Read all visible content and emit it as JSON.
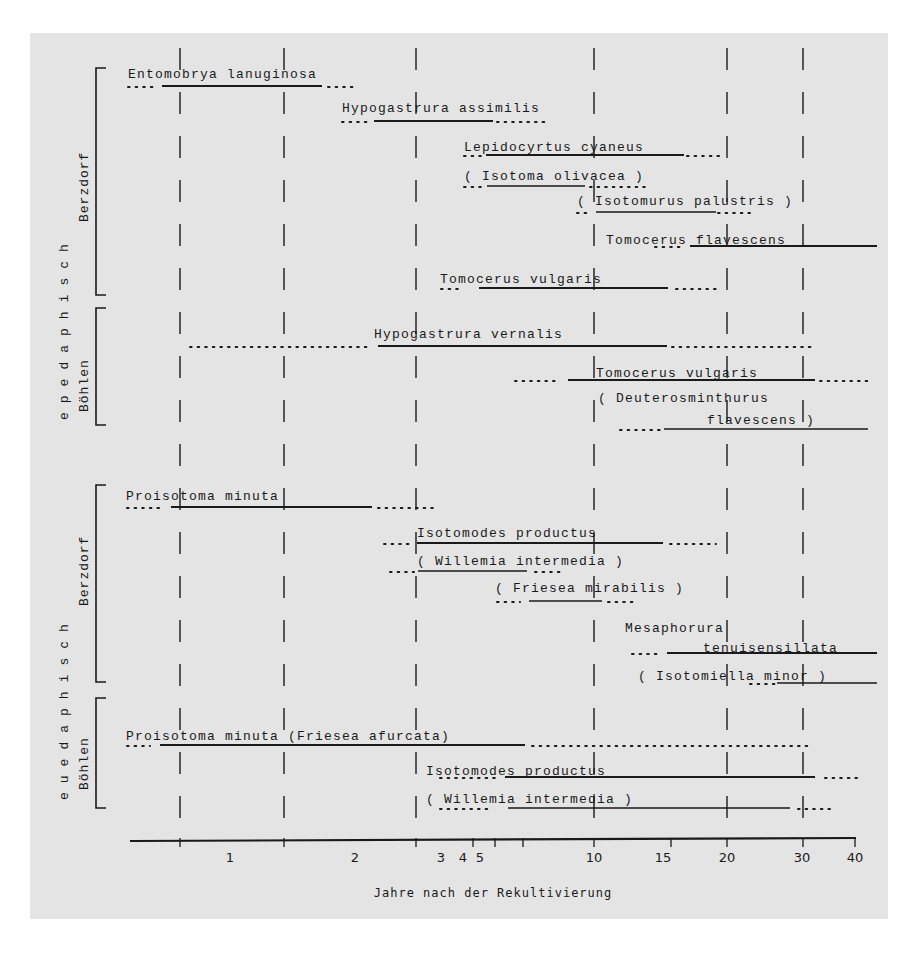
{
  "chart_data": {
    "type": "timeline",
    "title": "",
    "xlabel": "Jahre nach der Rekultivierung",
    "ylabel": "",
    "x_scale": "log-like (years)",
    "xlim": [
      0,
      40
    ],
    "x_ticks": [
      {
        "label": "",
        "px": 180
      },
      {
        "label": "1",
        "px": 230,
        "label_only": true
      },
      {
        "label": "",
        "px": 284
      },
      {
        "label": "2",
        "px": 355,
        "label_only": true
      },
      {
        "label": "",
        "px": 416
      },
      {
        "label": "3",
        "px": 444,
        "label_only": true
      },
      {
        "label": "4",
        "px": 462,
        "tick_px": 473
      },
      {
        "label": "5",
        "px": 480,
        "tick_px": 495
      },
      {
        "label": "",
        "px": 523
      },
      {
        "label": "10",
        "px": 594
      },
      {
        "label": "15",
        "px": 671
      },
      {
        "label": "20",
        "px": 727
      },
      {
        "label": "30",
        "px": 803
      },
      {
        "label": "40",
        "px": 855
      }
    ],
    "gridlines_dashed_px": [
      180,
      284,
      416,
      594,
      727,
      803
    ],
    "grid": "dashed vertical",
    "zones": [
      {
        "name": "epedaphisch",
        "y_top": 60,
        "y_bottom": 430
      },
      {
        "name": "euedaphisch",
        "y_top": 480,
        "y_bottom": 812
      }
    ],
    "groups": [
      {
        "name": "Berzdorf",
        "zone": "epedaphisch",
        "y_top": 68,
        "y_bottom": 295
      },
      {
        "name": "Böhlen",
        "zone": "epedaphisch",
        "y_top": 308,
        "y_bottom": 425
      },
      {
        "name": "Berzdorf",
        "zone": "euedaphisch",
        "y_top": 485,
        "y_bottom": 682
      },
      {
        "name": "Böhlen",
        "zone": "euedaphisch",
        "y_top": 698,
        "y_bottom": 808
      }
    ],
    "series": [
      {
        "name": "Entomobrya lanuginosa",
        "site": "Berzdorf",
        "zone": "epedaphisch",
        "parenthetical": false,
        "label_x": 128,
        "label_y": 78,
        "line_y": 86,
        "dots_pre": [
          128,
          158
        ],
        "solid": [
          162,
          322
        ],
        "dots_post": [
          328,
          358
        ]
      },
      {
        "name": "Hypogastrura assimilis",
        "site": "Berzdorf",
        "zone": "epedaphisch",
        "parenthetical": false,
        "label_x": 342,
        "label_y": 112,
        "line_y": 121,
        "dots_pre": [
          342,
          372
        ],
        "solid": [
          374,
          493
        ],
        "dots_post": [
          497,
          545
        ]
      },
      {
        "name": "Lepidocyrtus cyaneus",
        "site": "Berzdorf",
        "zone": "epedaphisch",
        "parenthetical": false,
        "label_x": 464,
        "label_y": 151,
        "line_y": 155,
        "dots_pre": [
          464,
          484
        ],
        "solid": [
          486,
          684
        ],
        "dots_post": [
          687,
          722
        ]
      },
      {
        "name": "( Isotoma olivacea )",
        "site": "Berzdorf",
        "zone": "epedaphisch",
        "parenthetical": true,
        "label_x": 464,
        "label_y": 180,
        "line_y": 186,
        "dots_pre": [
          464,
          484
        ],
        "solid": [
          487,
          585
        ],
        "dots_post": [
          590,
          650
        ]
      },
      {
        "name": "( Isotomurus palustris )",
        "site": "Berzdorf",
        "zone": "epedaphisch",
        "parenthetical": true,
        "label_x": 577,
        "label_y": 205,
        "line_y": 212,
        "dots_pre": [
          577,
          590
        ],
        "solid": [
          596,
          716
        ],
        "dots_post": [
          718,
          752
        ]
      },
      {
        "name": "Tomocerus flavescens",
        "site": "Berzdorf",
        "zone": "epedaphisch",
        "parenthetical": false,
        "label_x": 606,
        "label_y": 244,
        "line_y": 246,
        "dots_pre": [
          655,
          685
        ],
        "solid": [
          690,
          877
        ],
        "dots_post": null
      },
      {
        "name": "Tomocerus vulgaris",
        "site": "Berzdorf",
        "zone": "epedaphisch",
        "parenthetical": false,
        "label_x": 440,
        "label_y": 283,
        "line_y": 288,
        "dots_pre": [
          441,
          462
        ],
        "solid": [
          479,
          668
        ],
        "dots_post": [
          676,
          718
        ]
      },
      {
        "name": "Hypogastrura vernalis",
        "site": "Böhlen",
        "zone": "epedaphisch",
        "parenthetical": false,
        "label_x": 374,
        "label_y": 338,
        "line_y": 346,
        "dots_pre": [
          190,
          370
        ],
        "solid": [
          378,
          667
        ],
        "dots_post": [
          672,
          812
        ]
      },
      {
        "name": "Tomocerus vulgaris",
        "site": "Böhlen",
        "zone": "epedaphisch",
        "parenthetical": false,
        "label_x": 596,
        "label_y": 377,
        "line_y": 380,
        "dots_pre": [
          515,
          555
        ],
        "solid": [
          568,
          815
        ],
        "dots_post": [
          820,
          868
        ]
      },
      {
        "name": "( Deuterosminthurus",
        "name2": "flavescens )",
        "site": "Böhlen",
        "zone": "epedaphisch",
        "parenthetical": true,
        "label_x": 598,
        "label_y": 402,
        "label2_x": 707,
        "label2_y": 424,
        "line_y": 429,
        "dots_pre": [
          620,
          660
        ],
        "solid": [
          664,
          868
        ],
        "dots_post": null
      },
      {
        "name": "Proisotoma minuta",
        "site": "Berzdorf",
        "zone": "euedaphisch",
        "parenthetical": false,
        "label_x": 126,
        "label_y": 500,
        "line_y": 507,
        "dots_pre": [
          127,
          160
        ],
        "solid": [
          171,
          372
        ],
        "dots_post": [
          378,
          437
        ]
      },
      {
        "name": "Isotomodes productus",
        "site": "Berzdorf",
        "zone": "euedaphisch",
        "parenthetical": false,
        "label_x": 417,
        "label_y": 537,
        "line_y": 543,
        "dots_pre": [
          384,
          410
        ],
        "solid": [
          417,
          663
        ],
        "dots_post": [
          670,
          716
        ]
      },
      {
        "name": "( Willemia intermedia )",
        "site": "Berzdorf",
        "zone": "euedaphisch",
        "parenthetical": true,
        "label_x": 417,
        "label_y": 565,
        "line_y": 571,
        "dots_pre": [
          390,
          414
        ],
        "solid": [
          418,
          527
        ],
        "dots_post": [
          535,
          560
        ]
      },
      {
        "name": "( Friesea mirabilis )",
        "site": "Berzdorf",
        "zone": "euedaphisch",
        "parenthetical": true,
        "label_x": 495,
        "label_y": 592,
        "line_y": 601,
        "dots_pre": [
          497,
          520
        ],
        "solid": [
          529,
          602
        ],
        "dots_post": [
          608,
          634
        ]
      },
      {
        "name": "Mesaphorura",
        "name2": "tenuisensillata",
        "site": "Berzdorf",
        "zone": "euedaphisch",
        "parenthetical": false,
        "label_x": 625,
        "label_y": 632,
        "label2_x": 703,
        "label2_y": 652,
        "line_y": 653,
        "dots_pre": [
          632,
          660
        ],
        "solid": [
          667,
          877
        ],
        "dots_post": null
      },
      {
        "name": "( Isotomiella minor )",
        "site": "Berzdorf",
        "zone": "euedaphisch",
        "parenthetical": true,
        "label_x": 638,
        "label_y": 680,
        "line_y": 683,
        "dots_pre": [
          750,
          775
        ],
        "solid": [
          777,
          877
        ],
        "dots_post": null
      },
      {
        "name": "Proisotoma minuta (Friesea afurcata)",
        "site": "Böhlen",
        "zone": "euedaphisch",
        "parenthetical": false,
        "label_x": 126,
        "label_y": 740,
        "line_y": 745,
        "dots_pre": [
          127,
          150
        ],
        "solid": [
          160,
          525
        ],
        "dots_post": [
          532,
          812
        ]
      },
      {
        "name": "Isotomodes productus",
        "site": "Böhlen",
        "zone": "euedaphisch",
        "parenthetical": false,
        "label_x": 426,
        "label_y": 775,
        "line_y": 777,
        "dots_pre": [
          440,
          495
        ],
        "solid": [
          505,
          815
        ],
        "dots_post": [
          825,
          860
        ]
      },
      {
        "name": "( Willemia intermedia )",
        "site": "Böhlen",
        "zone": "euedaphisch",
        "parenthetical": true,
        "label_x": 426,
        "label_y": 803,
        "line_y": 808,
        "dots_pre": [
          440,
          490
        ],
        "solid": [
          508,
          790
        ],
        "dots_post": [
          798,
          830
        ]
      }
    ],
    "legend": "solid line = present; dotted line = sporadic/uncertain; parentheses = uncertain assignment"
  },
  "axis": {
    "title": "Jahre nach der Rekultivierung",
    "line": {
      "x1": 130,
      "x2": 856,
      "y": 840
    },
    "ticks": [
      {
        "x": 180,
        "label": ""
      },
      {
        "x": 284,
        "label": ""
      },
      {
        "x": 416,
        "label": ""
      },
      {
        "x": 473,
        "label": ""
      },
      {
        "x": 495,
        "label": ""
      },
      {
        "x": 523,
        "label": ""
      },
      {
        "x": 594,
        "label": ""
      },
      {
        "x": 671,
        "label": ""
      },
      {
        "x": 727,
        "label": ""
      },
      {
        "x": 803,
        "label": ""
      },
      {
        "x": 855,
        "label": ""
      }
    ],
    "tick_labels": [
      {
        "x": 230,
        "label": "1"
      },
      {
        "x": 355,
        "label": "2"
      },
      {
        "x": 441,
        "label": "3"
      },
      {
        "x": 463,
        "label": "4"
      },
      {
        "x": 480,
        "label": "5"
      },
      {
        "x": 594,
        "label": "10"
      },
      {
        "x": 663,
        "label": "15"
      },
      {
        "x": 727,
        "label": "20"
      },
      {
        "x": 802,
        "label": "30"
      },
      {
        "x": 855,
        "label": "40"
      }
    ]
  },
  "side_labels": {
    "zone_top": "epedaphisch",
    "zone_bottom": "euedaphisch",
    "group_1": "Berzdorf",
    "group_2": "Böhlen",
    "group_3": "Berzdorf",
    "group_4": "Böhlen"
  },
  "colors": {
    "panel": "#e4e4e4",
    "ink": "#1a1a1a",
    "page": "#ffffff"
  }
}
